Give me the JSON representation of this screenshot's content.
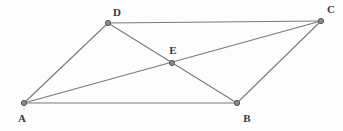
{
  "figure": {
    "background_color": "#fdfdfd",
    "stroke_color": "#7a7a7a",
    "vertex_fill_color": "#8c8c8c",
    "vertex_stroke_color": "#555555",
    "label_color": "#3a3a3a",
    "width": 343,
    "height": 131
  },
  "chart_data": {
    "type": "diagram",
    "coordinate_system": "pixels, origin top-left",
    "points": [
      {
        "id": "A",
        "label": "A",
        "x": 24,
        "y": 103,
        "label_x": 22,
        "label_y": 118
      },
      {
        "id": "B",
        "label": "B",
        "x": 237,
        "y": 103,
        "label_x": 247,
        "label_y": 118
      },
      {
        "id": "C",
        "label": "C",
        "x": 321,
        "y": 21,
        "label_x": 331,
        "label_y": 9
      },
      {
        "id": "D",
        "label": "D",
        "x": 108,
        "y": 23,
        "label_x": 117,
        "label_y": 12
      },
      {
        "id": "E",
        "label": "E",
        "x": 172,
        "y": 63,
        "label_x": 173,
        "label_y": 50
      }
    ],
    "segments": [
      {
        "id": "AB",
        "from": "A",
        "to": "B"
      },
      {
        "id": "DC",
        "from": "D",
        "to": "C"
      },
      {
        "id": "AD",
        "from": "A",
        "to": "D"
      },
      {
        "id": "BC",
        "from": "B",
        "to": "C"
      },
      {
        "id": "AC",
        "from": "A",
        "to": "C"
      },
      {
        "id": "DB",
        "from": "D",
        "to": "B"
      }
    ]
  }
}
